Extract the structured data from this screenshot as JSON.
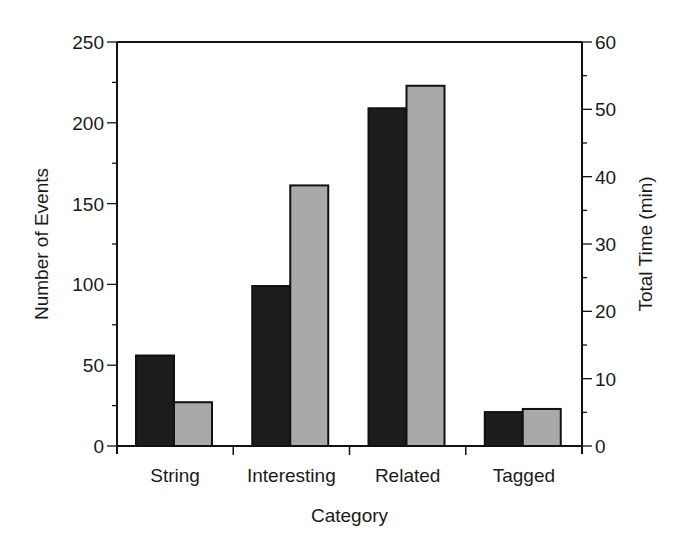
{
  "chart_data": {
    "type": "bar",
    "title": "",
    "xlabel": "Category",
    "ylabel": "Number of Events",
    "y2label": "Total Time (min)",
    "categories": [
      "String",
      "Interesting",
      "Related",
      "Tagged"
    ],
    "series": [
      {
        "name": "Number of Events",
        "axis": "left",
        "color": "#1c1c1c",
        "values": [
          56,
          99,
          209,
          21
        ]
      },
      {
        "name": "Total Time (min)",
        "axis": "right",
        "color": "#a9a9a9",
        "values": [
          6.5,
          38.7,
          53.5,
          5.5
        ]
      }
    ],
    "ylim": [
      0,
      250
    ],
    "y2lim": [
      0,
      60
    ],
    "yticks": [
      0,
      50,
      100,
      150,
      200,
      250
    ],
    "y2ticks": [
      0,
      10,
      20,
      30,
      40,
      50,
      60
    ],
    "grid": false,
    "legend": "none"
  }
}
